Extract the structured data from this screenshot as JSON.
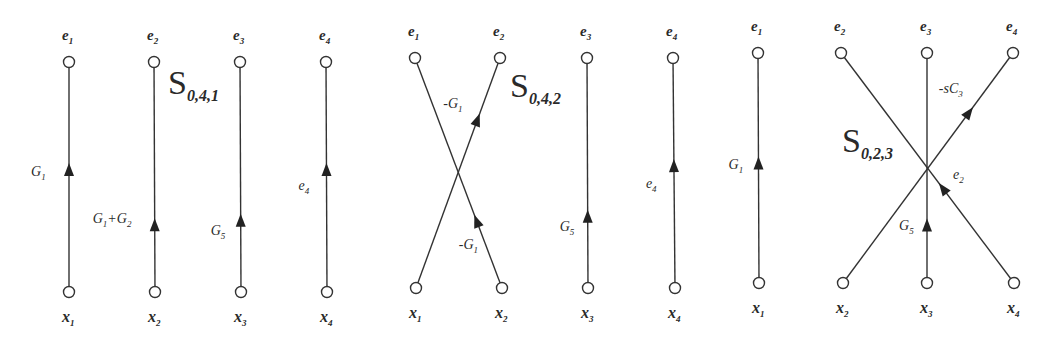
{
  "diagrams": [
    {
      "id": "S041",
      "title": {
        "main": "S",
        "sub": "0,4,1",
        "x": 168,
        "y": 94
      },
      "nodes_top": [
        {
          "label": "e",
          "sub": "1",
          "x": 69,
          "y": 62
        },
        {
          "label": "e",
          "sub": "2",
          "x": 154,
          "y": 62
        },
        {
          "label": "e",
          "sub": "3",
          "x": 240,
          "y": 62
        },
        {
          "label": "e",
          "sub": "4",
          "x": 326,
          "y": 62
        }
      ],
      "nodes_bottom": [
        {
          "label": "x",
          "sub": "1",
          "x": 69,
          "y": 292
        },
        {
          "label": "x",
          "sub": "2",
          "x": 155,
          "y": 292
        },
        {
          "label": "x",
          "sub": "3",
          "x": 241,
          "y": 292
        },
        {
          "label": "x",
          "sub": "4",
          "x": 327,
          "y": 292
        }
      ],
      "edges": [
        {
          "from": "x1",
          "to": "e1",
          "gain": "G",
          "gain_sub": "1",
          "gain_prefix": "",
          "gain_suffix": "",
          "arrow_t": 0.53,
          "label_dx": -38,
          "label_dy": 6
        },
        {
          "from": "x2",
          "to": "e2",
          "gain": "G",
          "gain_sub": "1",
          "gain_prefix": "",
          "gain_suffix": "+G",
          "gain_suffix_sub": "2",
          "arrow_t": 0.29,
          "label_dx": -62,
          "label_dy": -2
        },
        {
          "from": "x3",
          "to": "e3",
          "gain": "G",
          "gain_sub": "5",
          "gain_prefix": "",
          "gain_suffix": "",
          "arrow_t": 0.31,
          "label_dx": -30,
          "label_dy": 14
        },
        {
          "from": "x4",
          "to": "e4",
          "gain": "e",
          "gain_sub": "4",
          "gain_prefix": "",
          "gain_suffix": "",
          "arrow_t": 0.53,
          "label_dx": -28,
          "label_dy": 20
        }
      ]
    },
    {
      "id": "S042",
      "title": {
        "main": "S",
        "sub": "0,4,2",
        "x": 510,
        "y": 97
      },
      "nodes_top": [
        {
          "label": "e",
          "sub": "1",
          "x": 415,
          "y": 58
        },
        {
          "label": "e",
          "sub": "2",
          "x": 500,
          "y": 58
        },
        {
          "label": "e",
          "sub": "3",
          "x": 587,
          "y": 58
        },
        {
          "label": "e",
          "sub": "4",
          "x": 673,
          "y": 58
        }
      ],
      "nodes_bottom": [
        {
          "label": "x",
          "sub": "1",
          "x": 416,
          "y": 288
        },
        {
          "label": "x",
          "sub": "2",
          "x": 502,
          "y": 288
        },
        {
          "label": "x",
          "sub": "3",
          "x": 588,
          "y": 288
        },
        {
          "label": "x",
          "sub": "4",
          "x": 675,
          "y": 288
        }
      ],
      "edges": [
        {
          "from": "x1",
          "to": "e2",
          "gain": "G",
          "gain_sub": "1",
          "gain_prefix": "-",
          "gain_suffix": "",
          "arrow_t": 0.73,
          "label_dx": -34,
          "label_dy": -12
        },
        {
          "from": "x2",
          "to": "e1",
          "gain": "G",
          "gain_sub": "1",
          "gain_prefix": "-",
          "gain_suffix": "",
          "arrow_t": 0.29,
          "label_dx": -18,
          "label_dy": 28
        },
        {
          "from": "x3",
          "to": "e3",
          "gain": "G",
          "gain_sub": "5",
          "gain_prefix": "",
          "gain_suffix": "",
          "arrow_t": 0.31,
          "label_dx": -28,
          "label_dy": 14
        },
        {
          "from": "x4",
          "to": "e4",
          "gain": "e",
          "gain_sub": "4",
          "gain_prefix": "",
          "gain_suffix": "",
          "arrow_t": 0.53,
          "label_dx": -28,
          "label_dy": 22
        }
      ]
    },
    {
      "id": "S023",
      "title": {
        "main": "S",
        "sub": "0,2,3",
        "x": 842,
        "y": 152
      },
      "nodes_top": [
        {
          "label": "e",
          "sub": "1",
          "x": 758,
          "y": 53
        },
        {
          "label": "e",
          "sub": "2",
          "x": 841,
          "y": 53
        },
        {
          "label": "e",
          "sub": "3",
          "x": 927,
          "y": 53
        },
        {
          "label": "e",
          "sub": "4",
          "x": 1013,
          "y": 53
        }
      ],
      "nodes_bottom": [
        {
          "label": "x",
          "sub": "1",
          "x": 759,
          "y": 283
        },
        {
          "label": "x",
          "sub": "2",
          "x": 843,
          "y": 283
        },
        {
          "label": "x",
          "sub": "3",
          "x": 927,
          "y": 283
        },
        {
          "label": "x",
          "sub": "4",
          "x": 1014,
          "y": 283
        }
      ],
      "edges": [
        {
          "from": "x1",
          "to": "e1",
          "gain": "G",
          "gain_sub": "1",
          "gain_prefix": "",
          "gain_suffix": "",
          "arrow_t": 0.52,
          "label_dx": -30,
          "label_dy": 6
        },
        {
          "from": "x2",
          "to": "e4",
          "gain": "C",
          "gain_sub": "3",
          "gain_prefix": "-s",
          "gain_suffix": "",
          "arrow_t": 0.74,
          "label_dx": -30,
          "label_dy": -20
        },
        {
          "from": "x3",
          "to": "e3",
          "gain": "G",
          "gain_sub": "5",
          "gain_prefix": "",
          "gain_suffix": "",
          "arrow_t": 0.25,
          "label_dx": -28,
          "label_dy": 4
        },
        {
          "from": "x4",
          "to": "e2",
          "gain": "e",
          "gain_sub": "2",
          "gain_prefix": "",
          "gain_suffix": "",
          "arrow_t": 0.41,
          "label_dx": 10,
          "label_dy": -10
        }
      ]
    }
  ],
  "colors": {
    "line": "#333333",
    "arrow": "#222222",
    "text": "#2a2a2a",
    "background": "#ffffff"
  }
}
